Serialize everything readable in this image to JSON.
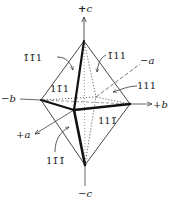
{
  "diagram": {
    "axes": {
      "plus_c": "+c",
      "minus_c": "−c",
      "plus_b": "+b",
      "minus_b": "−b",
      "plus_a": "+a",
      "minus_a": "−a"
    },
    "faces": {
      "face_bar1_bar1_1": "1̄1̄1",
      "face_bar1_1_1": "1̄11",
      "face_1_bar1_1": "11̄1",
      "face_1_1_1": "111",
      "face_1_1_bar1": "111̄",
      "face_1_bar1_bar1": "11̄1̄"
    },
    "colors": {
      "line": "#333333",
      "text": "#222222",
      "background": "#ffffff"
    }
  }
}
